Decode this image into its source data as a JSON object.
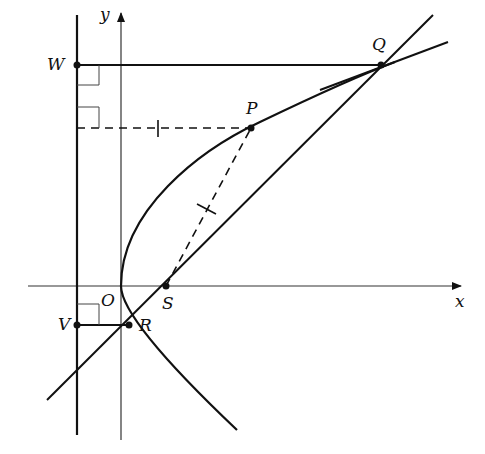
{
  "figure": {
    "type": "parabola focal chord diagram",
    "axes": {
      "x_label": "x",
      "y_label": "y"
    },
    "points": {
      "O": "O",
      "S": "S",
      "P": "P",
      "Q": "Q",
      "R": "R",
      "V": "V",
      "W": "W"
    },
    "colors": {
      "stroke": "#111111",
      "background": "#ffffff"
    }
  }
}
